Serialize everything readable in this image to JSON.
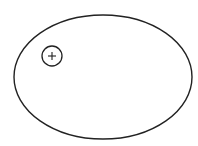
{
  "diagram": {
    "background": "#ffffff",
    "stroke_color": "#222222",
    "ellipse": {
      "cx": 103,
      "cy": 77,
      "rx": 89,
      "ry": 62,
      "stroke_width": 1.4
    },
    "charge": {
      "cx": 52,
      "cy": 56,
      "r": 10,
      "symbol": "+",
      "stroke_width": 1.3
    }
  }
}
